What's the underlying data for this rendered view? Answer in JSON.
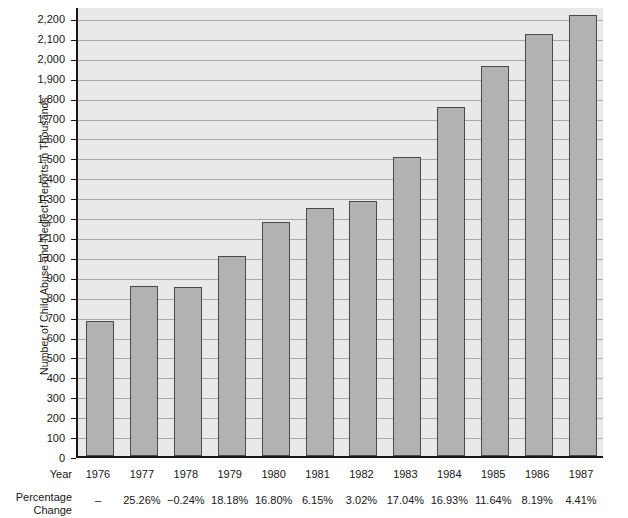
{
  "chart_data": {
    "type": "bar",
    "title": "",
    "xlabel": "Year",
    "ylabel": "Number of Child Abuse and Neglect Reports in Thousands",
    "categories": [
      "1976",
      "1977",
      "1978",
      "1979",
      "1980",
      "1981",
      "1982",
      "1983",
      "1984",
      "1985",
      "1986",
      "1987"
    ],
    "values": [
      680,
      852,
      850,
      1004,
      1173,
      1245,
      1282,
      1500,
      1754,
      1959,
      2120,
      2213
    ],
    "series": [
      {
        "name": "Number of Child Abuse and Neglect Reports in Thousands",
        "values": [
          680,
          852,
          850,
          1004,
          1173,
          1245,
          1282,
          1500,
          1754,
          1959,
          2120,
          2213
        ]
      }
    ],
    "percentage_change": [
      "–",
      "25.26%",
      "−0.24%",
      "18.18%",
      "16.80%",
      "6.15%",
      "3.02%",
      "17.04%",
      "16.93%",
      "11.64%",
      "8.19%",
      "4.41%"
    ],
    "ylim": [
      0,
      2260
    ],
    "y_ticks": [
      0,
      100,
      200,
      300,
      400,
      500,
      600,
      700,
      800,
      900,
      1000,
      1100,
      1200,
      1300,
      1400,
      1500,
      1600,
      1700,
      1800,
      1900,
      2000,
      2100,
      2200
    ],
    "y_tick_labels": [
      "0",
      "100",
      "200",
      "300",
      "400",
      "500",
      "600",
      "700",
      "800",
      "900",
      "1,000",
      "1,100",
      "1,200",
      "1,300",
      "1,400",
      "1,500",
      "1,600",
      "1,700",
      "1,800",
      "1,900",
      "2,000",
      "2,100",
      "2,200"
    ],
    "grid": true,
    "legend": "none",
    "colors": {
      "bar_fill": "#b2b2b2",
      "bar_edge": "#4a4a4a",
      "plot_background": "#e9e9e9",
      "gridline": "#a9a9a9",
      "axis": "#161616",
      "text": "#161616",
      "page_background": "#ffffff"
    }
  },
  "table": {
    "year_row_label": "Year",
    "percentage_row_label_line1": "Percentage",
    "percentage_row_label_line2": "Change"
  }
}
